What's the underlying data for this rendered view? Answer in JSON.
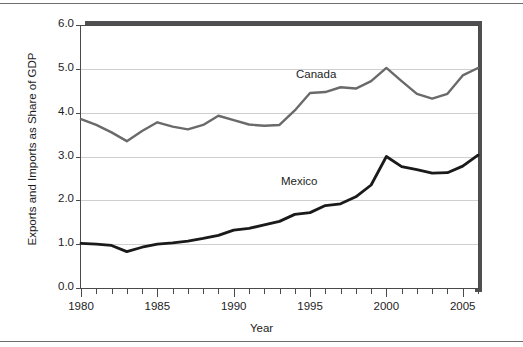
{
  "figure": {
    "background": "#ffffff",
    "frame_color": "#6e6e6e"
  },
  "axis_labels": {
    "x": "Year",
    "y": "Exports and Imports as Share of GDP"
  },
  "series_labels": {
    "canada": "Canada",
    "mexico": "Mexico"
  },
  "colors": {
    "canada_line": "#6a6a6a",
    "mexico_line": "#1a1a1a",
    "gridline": "#cfcfcf",
    "axis": "#4a4a4a",
    "plot_shadow": "#4f4f52",
    "text": "#1d1d1d"
  },
  "chart_data": {
    "type": "line",
    "title": "",
    "xlabel": "Year",
    "ylabel": "Exports and Imports as Share of GDP",
    "xlim": [
      1980,
      2006
    ],
    "ylim": [
      0.0,
      6.0
    ],
    "grid": true,
    "legend_position": "inline-annotations",
    "ytick_labels": [
      "0.0",
      "1.0",
      "2.0",
      "3.0",
      "4.0",
      "5.0",
      "6.0"
    ],
    "ytick_values": [
      0.0,
      1.0,
      2.0,
      3.0,
      4.0,
      5.0,
      6.0
    ],
    "xtick_labels": [
      "1980",
      "1985",
      "1990",
      "1995",
      "2000",
      "2005"
    ],
    "xtick_values": [
      1980,
      1985,
      1990,
      1995,
      2000,
      2005
    ],
    "x": [
      1980,
      1981,
      1982,
      1983,
      1984,
      1985,
      1986,
      1987,
      1988,
      1989,
      1990,
      1991,
      1992,
      1993,
      1994,
      1995,
      1996,
      1997,
      1998,
      1999,
      2000,
      2001,
      2002,
      2003,
      2004,
      2005,
      2006
    ],
    "series": [
      {
        "name": "Canada",
        "color": "#6a6a6a",
        "values": [
          3.85,
          3.72,
          3.55,
          3.35,
          3.58,
          3.78,
          3.68,
          3.62,
          3.72,
          3.93,
          3.83,
          3.73,
          3.7,
          3.72,
          4.05,
          4.45,
          4.47,
          4.58,
          4.55,
          4.72,
          5.02,
          4.72,
          4.43,
          4.32,
          4.43,
          4.85,
          5.02
        ]
      },
      {
        "name": "Mexico",
        "color": "#1a1a1a",
        "values": [
          1.02,
          1.0,
          0.97,
          0.83,
          0.93,
          1.0,
          1.03,
          1.07,
          1.13,
          1.2,
          1.32,
          1.36,
          1.44,
          1.52,
          1.68,
          1.72,
          1.88,
          1.92,
          2.08,
          2.35,
          3.0,
          2.77,
          2.7,
          2.62,
          2.63,
          2.78,
          3.03
        ]
      }
    ]
  }
}
